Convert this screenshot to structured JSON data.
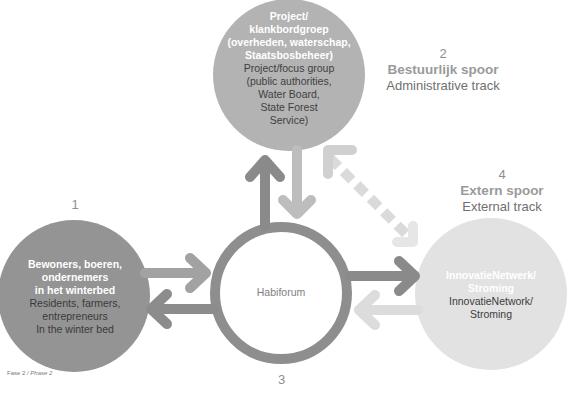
{
  "colors": {
    "dark_gray": "#8c8c8c",
    "mid_gray": "#ababab",
    "light_gray": "#d4d4d4",
    "very_light_gray": "#e3e3e3",
    "text_dark": "#4a4a4a"
  },
  "nodes": {
    "top": {
      "title_nl": "Project/\nklankbordgroep\n(overheden, waterschap,\nStaatsbosbeheer)",
      "title_en": "Project/focus group\n(public authorities,\nWater Board,\nState Forest\nService)"
    },
    "left": {
      "title_nl": "Bewoners, boeren,\nondernemers\nin het winterbed",
      "title_en": "Residents, farmers,\nentrepreneurs\nIn the winter bed"
    },
    "right": {
      "title_nl": "InnovatieNetwerk/\nStroming",
      "title_en": "InnovatieNetwork/\nStroming"
    },
    "hub": {
      "label": "Habiforum"
    }
  },
  "tracks": {
    "track1": {
      "number": "1"
    },
    "track2": {
      "number": "2",
      "title_nl": "Bestuurlijk spoor",
      "title_en": "Administrative track"
    },
    "track3": {
      "number": "3"
    },
    "track4": {
      "number": "4",
      "title_nl": "Extern spoor",
      "title_en": "External track"
    }
  },
  "footer": {
    "phase_nl": "Fase 2 / ",
    "phase_en": "Phase 2"
  }
}
